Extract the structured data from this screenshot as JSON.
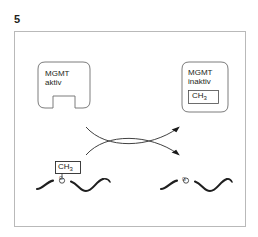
{
  "figure": {
    "number": "5",
    "caption": "",
    "frame_color": "#b9b9b9",
    "ink_color": "#231f20",
    "background": "#ffffff"
  },
  "diagram": {
    "type": "biochemical-reaction-schematic",
    "nodes": [
      {
        "id": "mgmt-active",
        "shape": "rounded-box-with-notch",
        "lines": [
          "MGMT",
          "aktiv"
        ],
        "position": {
          "x": 38,
          "y": 62,
          "w": 52,
          "h": 46
        }
      },
      {
        "id": "mgmt-inactive",
        "shape": "rounded-box",
        "lines": [
          "MGMT",
          "inaktiv"
        ],
        "badge": {
          "text": "CH",
          "subscript": "3"
        },
        "position": {
          "x": 182,
          "y": 62,
          "w": 46,
          "h": 50
        }
      },
      {
        "id": "dna-methylated",
        "shape": "wavy-strand",
        "base": "G",
        "methyl": {
          "text": "CH",
          "subscript": "3"
        },
        "position": {
          "x": 36,
          "y": 160,
          "w": 76,
          "h": 44
        }
      },
      {
        "id": "dna-demethylated",
        "shape": "wavy-strand",
        "base": "G",
        "methyl": null,
        "position": {
          "x": 160,
          "y": 172,
          "w": 72,
          "h": 34
        }
      }
    ],
    "arrows": [
      {
        "id": "arrow-upper",
        "from": "dna-methylated-region",
        "to": "mgmt-inactive",
        "direction": "right-up",
        "style": "curved"
      },
      {
        "id": "arrow-lower",
        "from": "mgmt-active",
        "to": "dna-demethylated",
        "direction": "right-down",
        "style": "curved"
      }
    ]
  },
  "labels": {
    "mgmt_active_line1": "MGMT",
    "mgmt_active_line2": "aktiv",
    "mgmt_inactive_line1": "MGMT",
    "mgmt_inactive_line2": "inaktiv",
    "methyl_text": "CH",
    "methyl_subscript": "3",
    "base_guanine": "G"
  }
}
